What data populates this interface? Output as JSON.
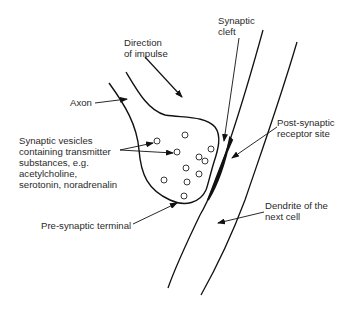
{
  "diagram": {
    "type": "synapse-illustration",
    "labels": {
      "direction": [
        "Direction",
        "of impulse"
      ],
      "cleft": [
        "Synaptic",
        "cleft"
      ],
      "axon": "Axon",
      "post_synaptic": [
        "Post-synaptic",
        "receptor site"
      ],
      "vesicles": [
        "Synaptic vesicles",
        "containing transmitter",
        "substances, e.g.",
        "acetylcholine,",
        "serotonin, noradrenalin"
      ],
      "pre_synaptic": "Pre-synaptic terminal",
      "dendrite": [
        "Dendrite of the",
        "next cell"
      ]
    },
    "colors": {
      "line": "#111111",
      "text": "#2a2a2a",
      "background": "#ffffff"
    }
  }
}
